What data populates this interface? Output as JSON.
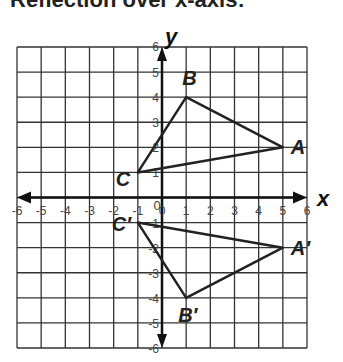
{
  "title": "Reflection over x-axis:",
  "chart_data": {
    "type": "scatter",
    "title": "Reflection over x-axis:",
    "xlabel": "x",
    "ylabel": "y",
    "xlim": [
      -6,
      6
    ],
    "ylim": [
      -6,
      6
    ],
    "grid": true,
    "x_ticks": [
      -6,
      -5,
      -4,
      -3,
      -2,
      -1,
      0,
      1,
      2,
      3,
      4,
      5,
      6
    ],
    "y_ticks": [
      6,
      5,
      4,
      3,
      2,
      1,
      -1,
      -2,
      -3,
      -4,
      -5,
      -6
    ],
    "origin_label": "0",
    "triangles": [
      {
        "name": "ABC",
        "points": [
          {
            "label": "A",
            "x": 5,
            "y": 2
          },
          {
            "label": "B",
            "x": 1,
            "y": 4
          },
          {
            "label": "C",
            "x": -1,
            "y": 1
          }
        ]
      },
      {
        "name": "A'B'C'",
        "points": [
          {
            "label": "A′",
            "x": 5,
            "y": -2
          },
          {
            "label": "B′",
            "x": 1,
            "y": -4
          },
          {
            "label": "C′",
            "x": -1,
            "y": -1
          }
        ]
      }
    ]
  }
}
